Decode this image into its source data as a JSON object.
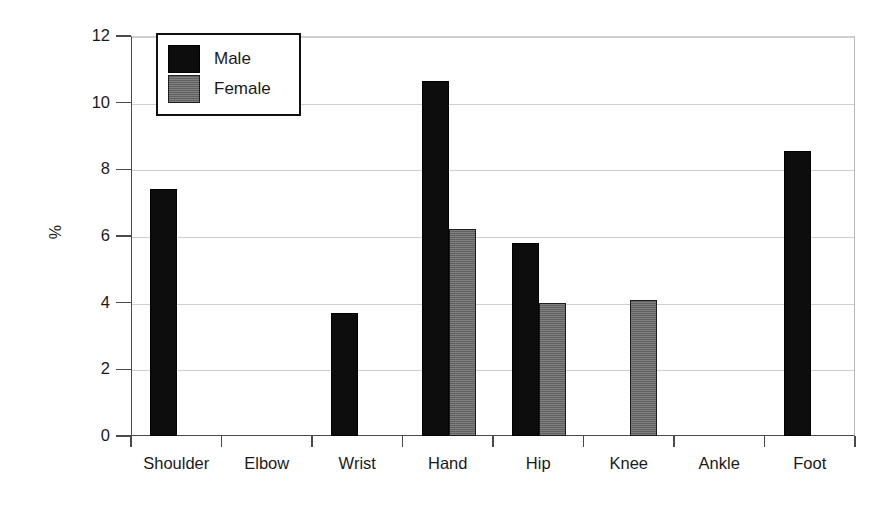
{
  "chart_data": {
    "type": "bar",
    "title": "",
    "xlabel": "",
    "ylabel": "%",
    "ylim": [
      0,
      12
    ],
    "ytick_step": 2,
    "yticks": [
      "0",
      "2",
      "4",
      "6",
      "8",
      "10",
      "12"
    ],
    "grid": "horizontal",
    "legend_position": "top-left-inside",
    "categories": [
      "Shoulder",
      "Elbow",
      "Wrist",
      "Hand",
      "Hip",
      "Knee",
      "Ankle",
      "Foot"
    ],
    "series": [
      {
        "name": "Male",
        "color": "#0d0d0d",
        "values": [
          7.4,
          0,
          3.69,
          10.65,
          5.78,
          0,
          0,
          8.55
        ]
      },
      {
        "name": "Female",
        "color": "#6b6b6b",
        "values": [
          0,
          0,
          0,
          6.2,
          4.0,
          4.08,
          0,
          0
        ]
      }
    ]
  },
  "legend": {
    "items": [
      {
        "label": "Male",
        "swatch": "black-swatch"
      },
      {
        "label": "Female",
        "swatch": "gray-swatch"
      }
    ]
  },
  "axes": {
    "y_axis_label": "%",
    "y_tick_labels": [
      "12",
      "10",
      "8",
      "6",
      "4",
      "2",
      "0"
    ],
    "x_tick_labels": [
      "Shoulder",
      "Elbow",
      "Wrist",
      "Hand",
      "Hip",
      "Knee",
      "Ankle",
      "Foot"
    ]
  },
  "colors": {
    "male": "#0d0d0d",
    "female": "#6b6b6b",
    "gridline": "#cfcfcf",
    "axis": "#4a4a4a",
    "background": "#ffffff"
  }
}
